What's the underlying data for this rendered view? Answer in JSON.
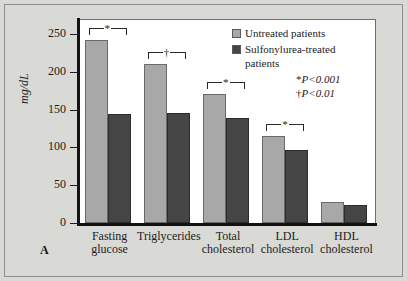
{
  "figure": {
    "panel_label": "A",
    "background_color": "#d9d9d6",
    "plot_background_color": "#ffffff"
  },
  "legend": {
    "position": "top-right",
    "entries": [
      {
        "label": "Untreated patients",
        "color": "#a8a8a8"
      },
      {
        "label": "Sulfonylurea-treated patients",
        "color": "#454545"
      }
    ]
  },
  "annotations": {
    "pvalues": [
      {
        "symbol": "*",
        "text": "P<0.001"
      },
      {
        "symbol": "†",
        "text": "P<0.01"
      }
    ],
    "brackets": [
      {
        "category": "Fasting glucose",
        "symbol": "*"
      },
      {
        "category": "Triglycerides",
        "symbol": "†"
      },
      {
        "category": "Total cholesterol",
        "symbol": "*"
      },
      {
        "category": "LDL cholesterol",
        "symbol": "*"
      }
    ]
  },
  "chart_data": {
    "type": "bar",
    "title": "",
    "xlabel": "",
    "ylabel": "mg/dL",
    "ylim": [
      0,
      265
    ],
    "yticks": [
      0,
      50,
      100,
      150,
      200,
      250
    ],
    "ytick_labels": [
      "0",
      "50",
      "100",
      "150",
      "200",
      "250"
    ],
    "grid": false,
    "legend_position": "top-right",
    "categories": [
      "Fasting glucose",
      "Triglycerides",
      "Total cholesterol",
      "LDL cholesterol",
      "HDL cholesterol"
    ],
    "category_lines": [
      [
        "Fasting",
        "glucose"
      ],
      [
        "Triglycerides",
        ""
      ],
      [
        "Total",
        "cholesterol"
      ],
      [
        "LDL",
        "cholesterol"
      ],
      [
        "HDL",
        "cholesterol"
      ]
    ],
    "series": [
      {
        "name": "Untreated patients",
        "color": "#a8a8a8",
        "values": [
          242,
          210,
          171,
          115,
          28
        ]
      },
      {
        "name": "Sulfonylurea-treated patients",
        "color": "#454545",
        "values": [
          144,
          146,
          139,
          97,
          24
        ]
      }
    ]
  }
}
